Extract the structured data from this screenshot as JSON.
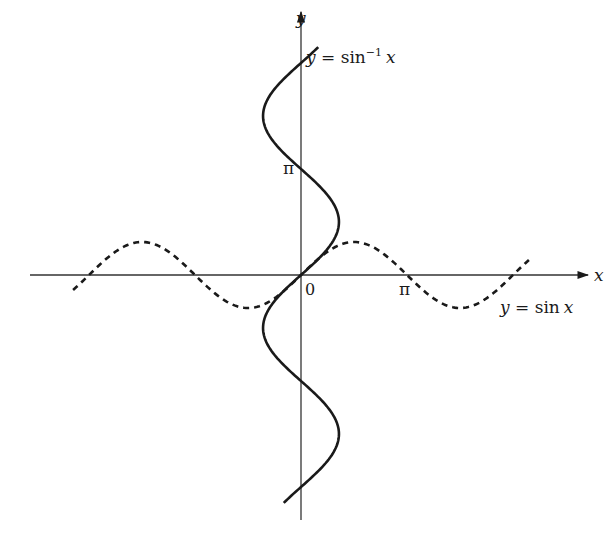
{
  "figure": {
    "colors": {
      "ink": "#1a1a1a",
      "axis": "#333333",
      "background": "#ffffff"
    }
  },
  "axes": {
    "x_label": "x",
    "y_label": "y",
    "origin_label": "0",
    "x_tick_label": "π",
    "y_tick_label": "π"
  },
  "curves": {
    "sin": {
      "label_prefix": "y = ",
      "label_func": "sin",
      "label_var": "x",
      "style": "dashed",
      "domain_pi": [
        -2.15,
        2.15
      ]
    },
    "arcsin": {
      "label_prefix": "y = ",
      "label_func": "sin",
      "label_sup": "−1",
      "label_var": "x",
      "style": "solid",
      "range_pi": [
        -2.15,
        2.15
      ]
    }
  }
}
